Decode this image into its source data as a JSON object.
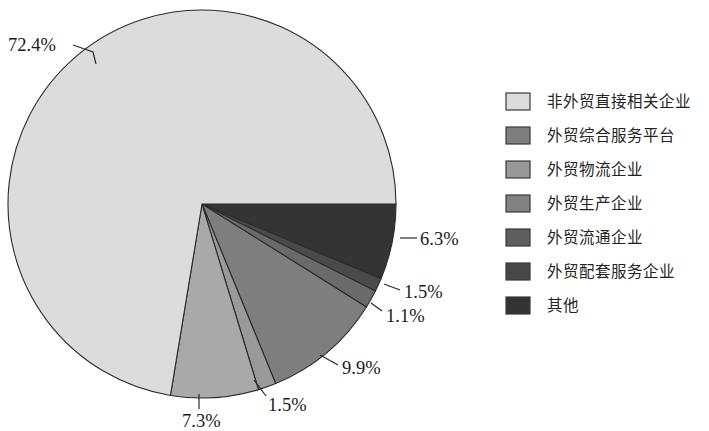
{
  "chart_data": {
    "type": "pie",
    "title": "",
    "subtitle": "",
    "xlabel": "",
    "ylabel": "",
    "grid": false,
    "legend_position": "right",
    "units": "percent",
    "start_angle_deg": 0,
    "direction": "clockwise",
    "center": {
      "x": 202,
      "y": 204
    },
    "radius": 194,
    "categories": [
      "非外贸直接相关企业",
      "外贸综合服务平台",
      "外贸物流企业",
      "外贸生产企业",
      "外贸流通企业",
      "外贸配套服务企业",
      "其他"
    ],
    "values": [
      72.4,
      9.9,
      7.3,
      1.5,
      1.5,
      1.1,
      6.3
    ],
    "value_labels": [
      "72.4%",
      "9.9%",
      "7.3%",
      "1.5%",
      "1.5%",
      "1.1%",
      "6.3%"
    ],
    "colors": [
      "#dcdcdc",
      "#7e7e7e",
      "#a9a9a9",
      "#9a9a9a",
      "#6a6a6a",
      "#4a4a4a",
      "#343434"
    ],
    "slice_order_clockwise": [
      {
        "category": "其他",
        "value": 6.3,
        "label": "6.3%",
        "color": "#343434"
      },
      {
        "category": "外贸配套服务企业",
        "value": 1.1,
        "label": "1.1%",
        "color": "#4a4a4a"
      },
      {
        "category": "外贸流通企业",
        "value": 1.5,
        "label": "1.5%",
        "color": "#6a6a6a"
      },
      {
        "category": "外贸综合服务平台",
        "value": 9.9,
        "label": "9.9%",
        "color": "#7e7e7e"
      },
      {
        "category": "外贸生产企业",
        "value": 1.5,
        "label": "1.5%",
        "color": "#9a9a9a"
      },
      {
        "category": "外贸物流企业",
        "value": 7.3,
        "label": "7.3%",
        "color": "#a9a9a9"
      },
      {
        "category": "非外贸直接相关企业",
        "value": 72.4,
        "label": "72.4%",
        "color": "#dcdcdc"
      }
    ]
  },
  "labels": {
    "p_72_4": "72.4%",
    "p_6_3": "6.3%",
    "p_1_5_right": "1.5%",
    "p_1_1": "1.1%",
    "p_9_9": "9.9%",
    "p_1_5_bottom": "1.5%",
    "p_7_3": "7.3%"
  },
  "legend": {
    "items": [
      {
        "label": "非外贸直接相关企业",
        "color": "#dcdcdc"
      },
      {
        "label": "外贸综合服务平台",
        "color": "#7e7e7e"
      },
      {
        "label": "外贸物流企业",
        "color": "#989898"
      },
      {
        "label": "外贸生产企业",
        "color": "#828282"
      },
      {
        "label": "外贸流通企业",
        "color": "#5e5e5e"
      },
      {
        "label": "外贸配套服务企业",
        "color": "#474747"
      },
      {
        "label": "其他",
        "color": "#343434"
      }
    ]
  }
}
